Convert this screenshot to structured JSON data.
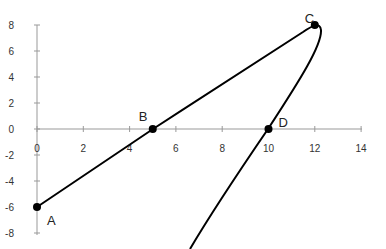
{
  "chart_data": {
    "type": "scatter",
    "title": "",
    "xlabel": "",
    "ylabel": "",
    "xlim": [
      0,
      14
    ],
    "ylim": [
      -8,
      8
    ],
    "grid": false,
    "legend": null,
    "x_ticks": [
      0,
      2,
      4,
      6,
      8,
      10,
      12,
      14
    ],
    "y_ticks": [
      -8,
      -6,
      -4,
      -2,
      0,
      2,
      4,
      6,
      8
    ],
    "x_tick_labels": [
      "0",
      "2",
      "4",
      "6",
      "8",
      "10",
      "12",
      "14"
    ],
    "y_tick_labels": [
      "8",
      "6",
      "4",
      "2",
      "0",
      "-2",
      "-4",
      "-6",
      "-8"
    ],
    "series": [
      {
        "name": "curve",
        "line_color": "#000000",
        "points": [
          {
            "x": 0,
            "y": -6
          },
          {
            "x": 5,
            "y": 0
          },
          {
            "x": 12,
            "y": 8
          },
          {
            "x": 12.2,
            "y": 7
          },
          {
            "x": 10,
            "y": 0
          },
          {
            "x": 6.7,
            "y": -9
          }
        ]
      }
    ],
    "labeled_points": [
      {
        "label": "A",
        "x": 0,
        "y": -6
      },
      {
        "label": "B",
        "x": 5,
        "y": 0
      },
      {
        "label": "C",
        "x": 12,
        "y": 8
      },
      {
        "label": "D",
        "x": 10,
        "y": 0
      }
    ]
  }
}
